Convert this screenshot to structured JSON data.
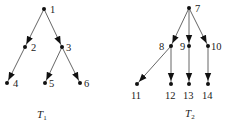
{
  "trees": [
    {
      "name": "T1",
      "label_main": "T",
      "label_sub": "1",
      "label_pos": [
        37,
        118
      ],
      "nodes": [
        {
          "id": "1",
          "x": 44,
          "y": 9,
          "label_dx": 6,
          "label_dy": 4
        },
        {
          "id": "2",
          "x": 25,
          "y": 47,
          "label_dx": 6,
          "label_dy": 4
        },
        {
          "id": "3",
          "x": 62,
          "y": 47,
          "label_dx": 4,
          "label_dy": 4
        },
        {
          "id": "4",
          "x": 7,
          "y": 83,
          "label_dx": 6,
          "label_dy": 4
        },
        {
          "id": "5",
          "x": 45,
          "y": 83,
          "label_dx": 4,
          "label_dy": 4
        },
        {
          "id": "6",
          "x": 80,
          "y": 83,
          "label_dx": 4,
          "label_dy": 4
        }
      ],
      "edges": [
        [
          "1",
          "2"
        ],
        [
          "1",
          "3"
        ],
        [
          "2",
          "4"
        ],
        [
          "3",
          "5"
        ],
        [
          "3",
          "6"
        ]
      ]
    },
    {
      "name": "T2",
      "label_main": "T",
      "label_sub": "2",
      "label_pos": [
        185,
        117
      ],
      "nodes": [
        {
          "id": "7",
          "x": 189,
          "y": 8,
          "label_dx": 6,
          "label_dy": 4
        },
        {
          "id": "8",
          "x": 171,
          "y": 46,
          "label_dx": -12,
          "label_dy": 4
        },
        {
          "id": "9",
          "x": 189,
          "y": 46,
          "label_dx": -9,
          "label_dy": 4
        },
        {
          "id": "10",
          "x": 208,
          "y": 46,
          "label_dx": 3,
          "label_dy": 4
        },
        {
          "id": "11",
          "x": 137,
          "y": 84,
          "label_dx": -6,
          "label_dy": 15
        },
        {
          "id": "12",
          "x": 171,
          "y": 84,
          "label_dx": -6,
          "label_dy": 15
        },
        {
          "id": "13",
          "x": 189,
          "y": 84,
          "label_dx": -6,
          "label_dy": 15
        },
        {
          "id": "14",
          "x": 208,
          "y": 84,
          "label_dx": -6,
          "label_dy": 15
        }
      ],
      "edges": [
        [
          "7",
          "8"
        ],
        [
          "7",
          "9"
        ],
        [
          "7",
          "10"
        ],
        [
          "8",
          "11"
        ],
        [
          "9",
          "13"
        ],
        [
          "8",
          "12"
        ],
        [
          "10",
          "14"
        ]
      ]
    }
  ]
}
